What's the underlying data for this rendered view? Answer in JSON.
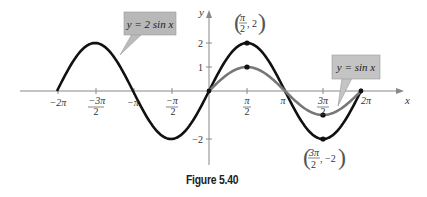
{
  "figure": {
    "caption": "Figure 5.40"
  },
  "chart_data": {
    "type": "line",
    "title": "",
    "xlabel": "x",
    "ylabel": "y",
    "x_ticks": [
      "−2π",
      "−3π/2",
      "−π",
      "−π/2",
      "π/2",
      "π",
      "3π/2",
      "2π"
    ],
    "y_ticks": [
      "2",
      "1",
      "−2"
    ],
    "xlim": [
      -6.2832,
      6.2832
    ],
    "ylim": [
      -2,
      2
    ],
    "grid": false,
    "series": [
      {
        "name": "y = 2 sin x",
        "domain": [
          -6.2832,
          6.2832
        ],
        "amplitude": 2,
        "color": "#111111",
        "points": [
          [
            -6.2832,
            0
          ],
          [
            -4.7124,
            2
          ],
          [
            -3.1416,
            0
          ],
          [
            -1.5708,
            -2
          ],
          [
            0,
            0
          ],
          [
            1.5708,
            2
          ],
          [
            3.1416,
            0
          ],
          [
            4.7124,
            -2
          ],
          [
            6.2832,
            0
          ]
        ]
      },
      {
        "name": "y = sin x",
        "domain": [
          0,
          6.2832
        ],
        "amplitude": 1,
        "color": "#777777",
        "points": [
          [
            0,
            0
          ],
          [
            1.5708,
            1
          ],
          [
            3.1416,
            0
          ],
          [
            4.7124,
            -1
          ],
          [
            6.2832,
            0
          ]
        ]
      }
    ],
    "annotations": [
      {
        "text": "(π/2, 2)",
        "x": 1.5708,
        "y": 2
      },
      {
        "text": "(3π/2, −2)",
        "x": 4.7124,
        "y": -2
      },
      {
        "text": "y = 2 sin x",
        "type": "callout"
      },
      {
        "text": "y = sin x",
        "type": "callout"
      }
    ]
  },
  "labels": {
    "x_axis": "x",
    "y_axis": "y",
    "callout_2sin": "y = 2 sin x",
    "callout_sin": "y = sin x",
    "tick_m2pi": "−2π",
    "tick_mpi": "−π",
    "tick_2pi": "2π",
    "tick_pi": "π",
    "y2": "2",
    "y1": "1",
    "ym2": "−2"
  }
}
